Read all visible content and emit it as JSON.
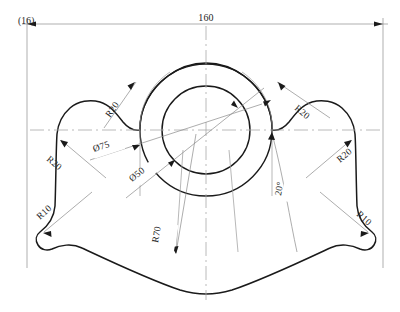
{
  "drawing": {
    "title": "Technical part outline drawing",
    "corner_label": "(16)",
    "line_color": "#1a1a1a",
    "construction_color": "#9a9a9a",
    "background": "#ffffff"
  },
  "dimensions": {
    "overall_width": "160",
    "bore_diameter": "Ø50",
    "boss_diameter": "Ø75",
    "bottom_radius": "R70",
    "angle": "20°",
    "fillet_upper_left": "R20",
    "fillet_upper_right": "R20",
    "fillet_mid_left": "R20",
    "fillet_mid_right": "R20",
    "fillet_lower_left": "R10",
    "fillet_lower_right": "R10"
  },
  "labels": [
    {
      "id": "corner",
      "text": "(16)"
    },
    {
      "id": "width",
      "text": "160"
    },
    {
      "id": "r20-upper-left",
      "text": "R20"
    },
    {
      "id": "r20-upper-right",
      "text": "R20"
    },
    {
      "id": "r20-mid-left",
      "text": "R20"
    },
    {
      "id": "r20-mid-right",
      "text": "R20"
    },
    {
      "id": "r10-lower-left",
      "text": "R10"
    },
    {
      "id": "r10-lower-right",
      "text": "R10"
    },
    {
      "id": "dia-75",
      "text": "Ø75"
    },
    {
      "id": "dia-50",
      "text": "Ø50"
    },
    {
      "id": "r70",
      "text": "R70"
    },
    {
      "id": "angle-20",
      "text": "20°"
    }
  ],
  "geometry": {
    "center_x": 206,
    "center_y": 130,
    "bore_radius_px": 44,
    "boss_radius_px": 66,
    "note": "two concentric circles at part center"
  }
}
